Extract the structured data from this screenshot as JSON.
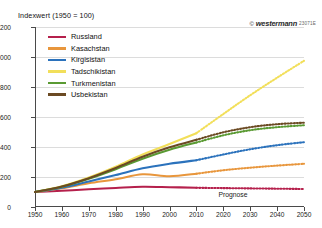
{
  "header": {
    "title": "Indexwert  (1950 = 100)",
    "credit_mark": "©",
    "credit_brand": "westermann",
    "credit_code": "23071E"
  },
  "annotations": {
    "prognose": "Prognose"
  },
  "chart_data": {
    "type": "line",
    "title": "Indexwert  (1950 = 100)",
    "xlabel": "",
    "ylabel": "Indexwert (1950 = 100)",
    "xlim": [
      1950,
      2050
    ],
    "ylim": [
      0,
      1200
    ],
    "yticks": [
      0,
      200,
      400,
      600,
      800,
      1000,
      1200
    ],
    "xticks": [
      1950,
      1960,
      1970,
      1980,
      1990,
      2000,
      2010,
      2020,
      2030,
      2040,
      2050
    ],
    "grid": "horizontal",
    "legend_position": "top-left",
    "forecast_start": 2010,
    "forecast_note": "Prognose",
    "x": [
      1950,
      1960,
      1970,
      1980,
      1990,
      2000,
      2010,
      2020,
      2030,
      2040,
      2050
    ],
    "series": [
      {
        "name": "Russland",
        "color": "#b5204c",
        "values": [
          100,
          108,
          118,
          127,
          135,
          132,
          128,
          126,
          124,
          122,
          120
        ]
      },
      {
        "name": "Kasachstan",
        "color": "#e8963c",
        "values": [
          100,
          125,
          158,
          185,
          218,
          205,
          222,
          245,
          262,
          276,
          288
        ]
      },
      {
        "name": "Kirgisistan",
        "color": "#2b72bc",
        "values": [
          100,
          128,
          170,
          213,
          258,
          288,
          312,
          350,
          385,
          412,
          432
        ]
      },
      {
        "name": "Tadschikistan",
        "color": "#f2df5a",
        "values": [
          100,
          138,
          196,
          268,
          350,
          420,
          492,
          620,
          745,
          862,
          975
        ]
      },
      {
        "name": "Turkmenistan",
        "color": "#5a9a33",
        "values": [
          100,
          135,
          188,
          252,
          322,
          382,
          430,
          478,
          512,
          532,
          545
        ]
      },
      {
        "name": "Usbekistan",
        "color": "#6b4a23",
        "values": [
          100,
          137,
          192,
          260,
          335,
          398,
          448,
          498,
          532,
          552,
          562
        ]
      }
    ]
  },
  "legend": [
    {
      "label": "Russland",
      "color": "#b5204c"
    },
    {
      "label": "Kasachstan",
      "color": "#e8963c"
    },
    {
      "label": "Kirgisistan",
      "color": "#2b72bc"
    },
    {
      "label": "Tadschikistan",
      "color": "#f2df5a"
    },
    {
      "label": "Turkmenistan",
      "color": "#5a9a33"
    },
    {
      "label": "Usbekistan",
      "color": "#6b4a23"
    }
  ]
}
